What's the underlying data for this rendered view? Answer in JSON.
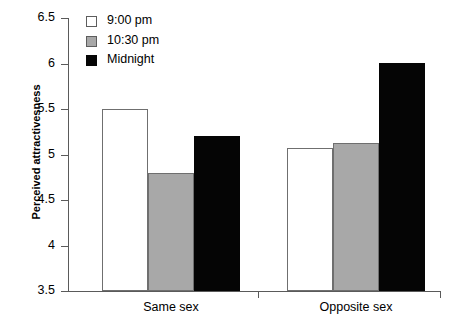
{
  "chart_data": {
    "type": "bar",
    "title": "",
    "xlabel": "",
    "ylabel": "Perceived attractivesness",
    "categories": [
      "Same sex",
      "Opposite sex"
    ],
    "ylim": [
      3.5,
      6.5
    ],
    "ytick_labels": [
      "6.5",
      "6",
      "5.5",
      "5",
      "4.5",
      "4",
      "3.5"
    ],
    "ytick_values": [
      6.5,
      6,
      5.5,
      5,
      4.5,
      4,
      3.5
    ],
    "grid": false,
    "legend_position": "top-left",
    "series": [
      {
        "name": "9:00 pm",
        "color": "#ffffff",
        "values": [
          5.5,
          5.07
        ]
      },
      {
        "name": "10:30 pm",
        "color": "#a8a8a8",
        "values": [
          4.8,
          5.13
        ]
      },
      {
        "name": "Midnight",
        "color": "#050505",
        "values": [
          5.2,
          6.01
        ]
      }
    ]
  },
  "legend": {
    "items": [
      {
        "label": "9:00 pm",
        "swatch": "white"
      },
      {
        "label": "10:30 pm",
        "swatch": "gray"
      },
      {
        "label": "Midnight",
        "swatch": "black"
      }
    ]
  },
  "axes": {
    "y_title": "Perceived attractivesness",
    "y_ticks": [
      "6.5",
      "6",
      "5.5",
      "5",
      "4.5",
      "4",
      "3.5"
    ],
    "x_categories": [
      "Same sex",
      "Opposite sex"
    ]
  }
}
